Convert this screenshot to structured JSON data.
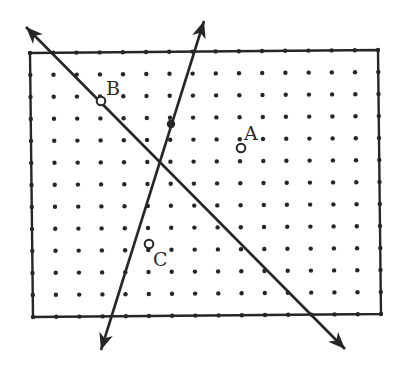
{
  "figure": {
    "width": 409,
    "height": 378,
    "ink_color": "#262626",
    "background": "#ffffff"
  },
  "grid": {
    "columns": 16,
    "rows": 13,
    "corners": {
      "top_left": [
        30,
        53
      ],
      "top_right": [
        378,
        50
      ],
      "bottom_left": [
        33,
        317
      ],
      "bottom_right": [
        381,
        314
      ]
    },
    "dot_radius": 2.2,
    "border_width": 2.4
  },
  "lines": [
    {
      "name": "line-through-b",
      "from": [
        26,
        27
      ],
      "to": [
        345,
        349
      ],
      "arrows": "both"
    },
    {
      "name": "steep-line",
      "from": [
        204,
        21
      ],
      "to": [
        101,
        350
      ],
      "arrows": "both"
    }
  ],
  "marked_points": [
    {
      "name": "point-on-steep-line",
      "x": 171,
      "y": 124,
      "style": "filled"
    }
  ],
  "labeled_points": [
    {
      "label": "A",
      "x": 241,
      "y": 148,
      "label_x": 244,
      "label_y": 140
    },
    {
      "label": "B",
      "x": 101,
      "y": 101,
      "label_x": 106,
      "label_y": 95
    },
    {
      "label": "C",
      "x": 149,
      "y": 244,
      "label_x": 153,
      "label_y": 266
    }
  ]
}
